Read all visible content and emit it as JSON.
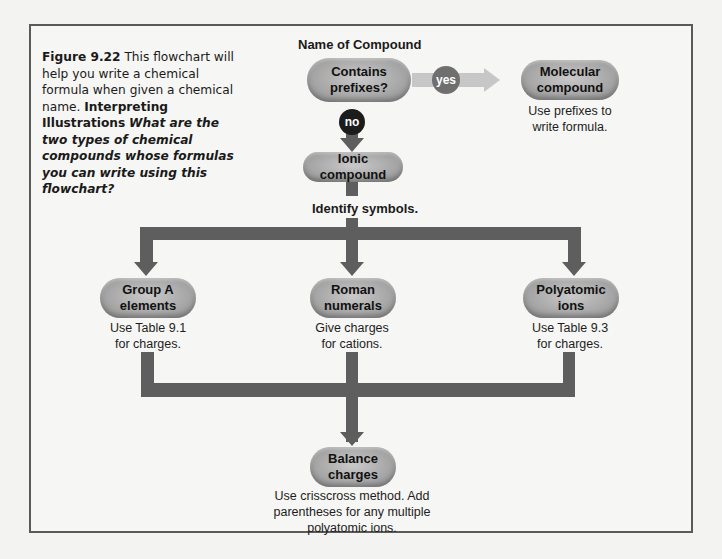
{
  "caption": {
    "figure_label": "Figure 9.22",
    "text": "This flowchart will help you write a chemical formula when given a chemical name.",
    "interpreting_label": "Interpreting Illustrations",
    "question": "What are the two types of chemical compounds whose formulas you can write using this flowchart?"
  },
  "flowchart": {
    "start_label": "Name of Compound",
    "decision": {
      "line1": "Contains",
      "line2": "prefixes?"
    },
    "yes_badge": "yes",
    "no_badge": "no",
    "molecular": {
      "line1": "Molecular",
      "line2": "compound",
      "note1": "Use prefixes to",
      "note2": "write formula."
    },
    "ionic": {
      "label": "Ionic compound",
      "note": "Identify symbols."
    },
    "group_a": {
      "line1": "Group A",
      "line2": "elements",
      "note1": "Use Table 9.1",
      "note2": "for charges."
    },
    "roman": {
      "line1": "Roman",
      "line2": "numerals",
      "note1": "Give charges",
      "note2": "for cations."
    },
    "polyatomic": {
      "line1": "Polyatomic",
      "line2": "ions",
      "note1": "Use Table 9.3",
      "note2": "for charges."
    },
    "balance": {
      "line1": "Balance",
      "line2": "charges",
      "note1": "Use crisscross method. Add",
      "note2": "parentheses for any multiple",
      "note3": "polyatomic ions."
    }
  },
  "colors": {
    "connector_dark": "#5e5e5e",
    "connector_light": "#c7c7c7",
    "pill_fill": "#a9a9a9",
    "no_badge": "#1c1c1c",
    "yes_badge": "#6f6f6f"
  }
}
